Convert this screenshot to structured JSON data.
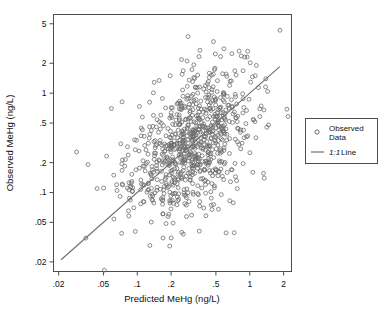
{
  "chart_data": {
    "type": "scatter",
    "title": "",
    "xlabel": "Predicted MeHg (ng/L)",
    "ylabel": "Observed MeHg (ng/L)",
    "xscale": "log",
    "yscale": "log",
    "xlim": [
      0.018,
      2.35
    ],
    "ylim": [
      0.016,
      6.2
    ],
    "grid": false,
    "xticks": [
      0.02,
      0.05,
      0.1,
      0.2,
      0.5,
      1,
      2
    ],
    "xticklabels": [
      ".02",
      ".05",
      ".1",
      ".2",
      ".5",
      "1",
      "2"
    ],
    "yticks": [
      0.02,
      0.05,
      0.1,
      0.2,
      0.5,
      1,
      2,
      5
    ],
    "yticklabels": [
      ".02",
      ".05",
      ".1",
      ".2",
      ".5",
      "1",
      "2",
      "5"
    ],
    "series": [
      {
        "name": "Observed Data",
        "type": "scatter",
        "marker": "open-circle",
        "marker_color": "#6b6b6b",
        "marker_size": 4,
        "n_points": 812,
        "x_center_log10": -0.52,
        "y_center_log10": -0.52,
        "x_spread_log10": 0.26,
        "correlation": 0.66,
        "y_residual_spread_log10": 0.31
      },
      {
        "name": "1:1 Line",
        "type": "line",
        "color": "#6e6e6e",
        "x": [
          0.021,
          1.85
        ],
        "y": [
          0.021,
          1.85
        ]
      }
    ],
    "legend": {
      "position": "right",
      "entries": [
        {
          "label_line1": "Observed",
          "label_line2": "Data",
          "marker": "open-circle"
        },
        {
          "label_em": "1:1",
          "label": "Line",
          "marker": "line"
        }
      ]
    }
  },
  "legend": {
    "observed_line1": "Observed",
    "observed_line2": "Data",
    "line_em": "1:1",
    "line_rest": "Line"
  },
  "axes": {
    "x_title": "Predicted MeHg (ng/L)",
    "y_title": "Observed MeHg (ng/L)",
    "x_tick_labels": [
      ".02",
      ".05",
      ".1",
      ".2",
      ".5",
      "1",
      "2"
    ],
    "y_tick_labels": [
      ".02",
      ".05",
      ".1",
      ".2",
      ".5",
      "1",
      "2",
      "5"
    ]
  },
  "colors": {
    "marker": "#6b6b6b",
    "line": "#6e6e6e",
    "frame": "#4d4d4d",
    "text": "#111111",
    "background": "#ffffff"
  }
}
